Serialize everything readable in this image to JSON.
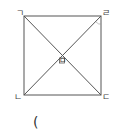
{
  "figure": {
    "type": "square-with-diagonals",
    "stroke_color": "#555555",
    "vertices": {
      "top_left": "ㄱ",
      "top_right": "ㄹ",
      "bottom_left": "ㄴ",
      "bottom_right": "ㄷ"
    },
    "center": "ㅁ"
  },
  "answer_blank": "("
}
